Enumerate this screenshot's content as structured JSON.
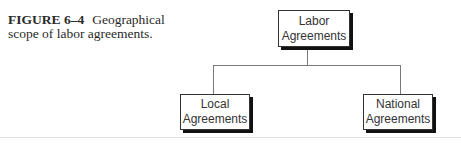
{
  "caption": {
    "label": "FIGURE 6–4",
    "text": "Geographical scope of labor agreements."
  },
  "diagram": {
    "root": {
      "line1": "Labor",
      "line2": "Agreements"
    },
    "children": [
      {
        "line1": "Local",
        "line2": "Agreements"
      },
      {
        "line1": "National",
        "line2": "Agreements"
      }
    ]
  }
}
